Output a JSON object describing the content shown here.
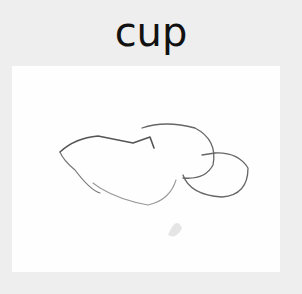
{
  "label": "cup",
  "colors": {
    "background": "#eeeeee",
    "panel": "#fefefe",
    "stroke": "#555555"
  }
}
